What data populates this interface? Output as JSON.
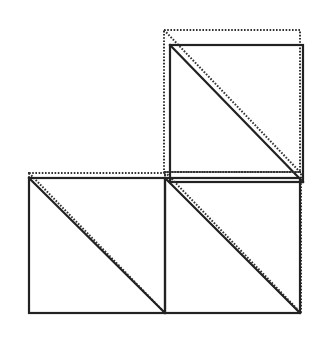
{
  "diagram": {
    "type": "geometric-tiling",
    "colors": {
      "background": "#ffffff",
      "stroke": "#222222",
      "dotted_stroke": "#333333"
    },
    "squares": [
      {
        "id": "top-right",
        "solid": {
          "x1": 170,
          "y1": 45,
          "x2": 303,
          "y2": 182
        },
        "dotted": {
          "x1": 164,
          "y1": 30,
          "x2": 300,
          "y2": 172
        },
        "diagonal": "top-left-to-bottom-right"
      },
      {
        "id": "bottom-left",
        "solid": {
          "x1": 29,
          "y1": 178,
          "x2": 165,
          "y2": 313
        },
        "dotted": {
          "x1": 29,
          "y1": 173,
          "x2": 165,
          "y2": 313
        },
        "diagonal": "top-left-to-bottom-right"
      },
      {
        "id": "bottom-right",
        "solid": {
          "x1": 165,
          "y1": 178,
          "x2": 300,
          "y2": 313
        },
        "dotted": {
          "x1": 165,
          "y1": 172,
          "x2": 301,
          "y2": 313
        },
        "diagonal": "top-left-to-bottom-right"
      }
    ]
  }
}
